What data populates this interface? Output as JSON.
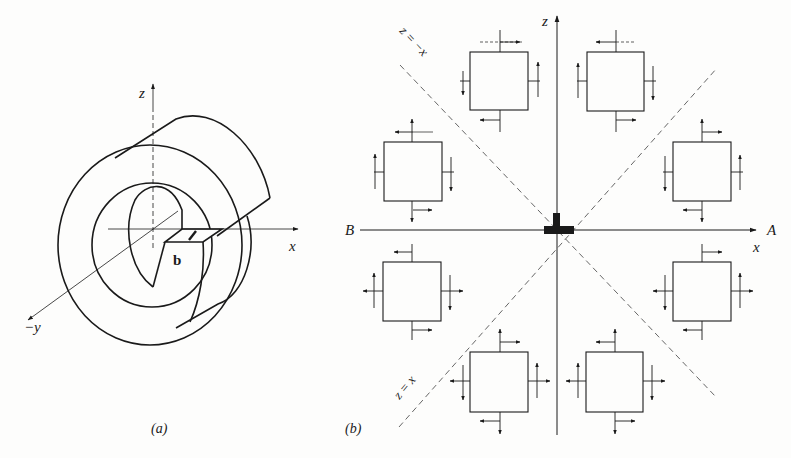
{
  "figure": {
    "panel_a": {
      "caption": "(a)",
      "axis_labels": {
        "z": "z",
        "x": "x",
        "neg_y": "−y"
      },
      "point_label": "b"
    },
    "panel_b": {
      "caption": "(b)",
      "axis_labels": {
        "z": "z",
        "x": "x"
      },
      "endpoint_labels": {
        "left": "B",
        "right": "A"
      },
      "diagonal_labels": {
        "upper_left": "z = −x",
        "lower_left": "z = x"
      },
      "element_count": 8
    },
    "colors": {
      "line": "#1a1a1a",
      "background": "#fdfdfc",
      "dashed": "#555555"
    }
  }
}
